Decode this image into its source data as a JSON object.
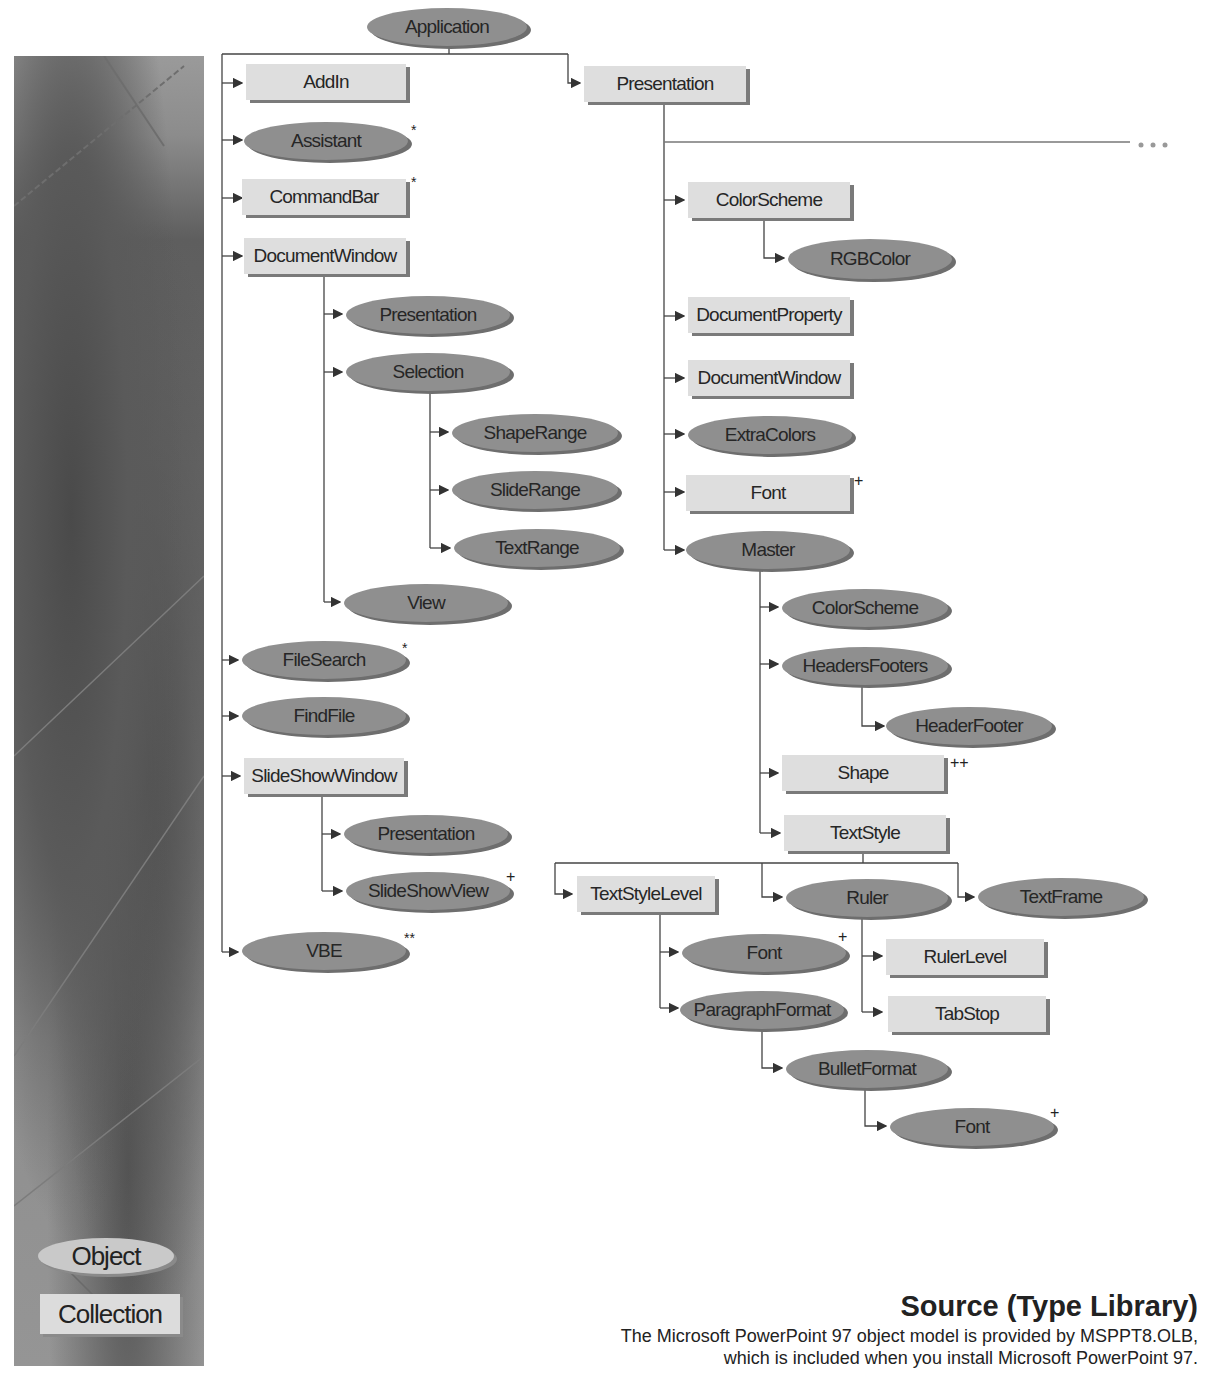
{
  "legend": {
    "object_label": "Object",
    "collection_label": "Collection"
  },
  "source": {
    "title": "Source (Type Library)",
    "line1": "The Microsoft PowerPoint 97 object model is provided by MSPPT8.OLB,",
    "line2": "which is included when you install Microsoft PowerPoint 97."
  },
  "continuation": "...",
  "nodes": {
    "application": "Application",
    "addin": "AddIn",
    "assistant": "Assistant",
    "commandbar": "CommandBar",
    "documentwindow": "DocumentWindow",
    "dw_presentation": "Presentation",
    "dw_selection": "Selection",
    "sel_shaperange": "ShapeRange",
    "sel_sliderange": "SlideRange",
    "sel_textrange": "TextRange",
    "dw_view": "View",
    "filesearch": "FileSearch",
    "findfile": "FindFile",
    "slideshowwindow": "SlideShowWindow",
    "ssw_presentation": "Presentation",
    "ssw_slideshowview": "SlideShowView",
    "vbe": "VBE",
    "presentation": "Presentation",
    "p_colorscheme": "ColorScheme",
    "p_rgbcolor": "RGBColor",
    "p_documentproperty": "DocumentProperty",
    "p_documentwindow": "DocumentWindow",
    "p_extracolors": "ExtraColors",
    "p_font": "Font",
    "p_master": "Master",
    "m_colorscheme": "ColorScheme",
    "m_headersfooters": "HeadersFooters",
    "m_headerfooter": "HeaderFooter",
    "m_shape": "Shape",
    "m_textstyle": "TextStyle",
    "ts_textstylelevel": "TextStyleLevel",
    "ts_ruler": "Ruler",
    "ts_textframe": "TextFrame",
    "tsl_font": "Font",
    "tsl_paragraphformat": "ParagraphFormat",
    "r_rulerlevel": "RulerLevel",
    "r_tabstop": "TabStop",
    "pf_bulletformat": "BulletFormat",
    "bf_font": "Font"
  },
  "marks": {
    "assistant": "*",
    "commandbar": "*",
    "filesearch": "*",
    "vbe": "**",
    "ssw_slideshowview": "+",
    "p_font": "+",
    "m_shape": "++",
    "tsl_font": "+",
    "bf_font": "+"
  }
}
